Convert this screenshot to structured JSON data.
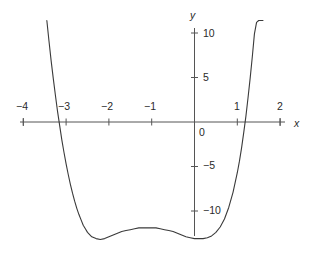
{
  "figure": {
    "background_color": "#ffffff",
    "curve_color": "#3a3a3a",
    "axis_color": "#555555",
    "text_color": "#2a2a2a"
  },
  "axes": {
    "x_axis_label": "x",
    "y_axis_label": "y",
    "x_ticks": [
      {
        "value": -4,
        "label": "−4"
      },
      {
        "value": -3,
        "label": "−3"
      },
      {
        "value": -2,
        "label": "−2"
      },
      {
        "value": -1,
        "label": "−1"
      },
      {
        "value": 1,
        "label": "1"
      },
      {
        "value": 2,
        "label": "2"
      }
    ],
    "y_ticks": [
      {
        "value": 10,
        "label": "10"
      },
      {
        "value": 5,
        "label": "5"
      },
      {
        "value": 0,
        "label": "0"
      },
      {
        "value": -5,
        "label": "−5"
      },
      {
        "value": -10,
        "label": "−10"
      }
    ],
    "origin_label": "0"
  },
  "chart_data": {
    "type": "line",
    "title": "",
    "subtitle": "",
    "xlabel": "x",
    "ylabel": "y",
    "xlim": [
      -4.4,
      2.4
    ],
    "ylim": [
      -13.2,
      11.5
    ],
    "grid": false,
    "legend": null,
    "series": [
      {
        "name": "quartic curve",
        "x": [
          -3.45,
          -3.4,
          -3.35,
          -3.3,
          -3.25,
          -3.2,
          -3.15,
          -3.1,
          -3.05,
          -3.0,
          -2.95,
          -2.9,
          -2.85,
          -2.8,
          -2.75,
          -2.7,
          -2.65,
          -2.6,
          -2.55,
          -2.5,
          -2.4,
          -2.3,
          -2.2,
          -2.1,
          -2.0,
          -1.9,
          -1.8,
          -1.7,
          -1.6,
          -1.5,
          -1.4,
          -1.3,
          -1.2,
          -1.1,
          -1.0,
          -0.9,
          -0.8,
          -0.7,
          -0.6,
          -0.5,
          -0.4,
          -0.3,
          -0.2,
          -0.1,
          0.0,
          0.1,
          0.2,
          0.3,
          0.4,
          0.5,
          0.6,
          0.7,
          0.8,
          0.9,
          1.0,
          1.05,
          1.1,
          1.15,
          1.2,
          1.25,
          1.3,
          1.35,
          1.4,
          1.45,
          1.5,
          1.55,
          1.6
        ],
        "y": [
          11.4,
          9.1,
          6.9,
          4.9,
          3.0,
          1.2,
          -0.4,
          -2.0,
          -3.4,
          -4.7,
          -5.9,
          -7.0,
          -8.0,
          -8.9,
          -9.7,
          -10.4,
          -11.0,
          -11.6,
          -12.0,
          -12.4,
          -12.9,
          -13.1,
          -13.2,
          -13.1,
          -12.9,
          -12.7,
          -12.5,
          -12.3,
          -12.2,
          -12.1,
          -12.0,
          -11.9,
          -11.9,
          -11.9,
          -11.9,
          -11.9,
          -12.0,
          -12.1,
          -12.2,
          -12.3,
          -12.5,
          -12.7,
          -12.9,
          -13.0,
          -13.1,
          -13.1,
          -13.1,
          -13.0,
          -12.8,
          -12.4,
          -11.8,
          -10.9,
          -9.6,
          -7.9,
          -5.7,
          -4.4,
          -2.9,
          -1.2,
          0.6,
          2.7,
          4.9,
          7.3,
          9.9,
          11.2,
          11.4,
          11.4,
          11.4
        ],
        "roots": [
          -3.07,
          1.03
        ],
        "local_minima": [
          {
            "x": -2.2,
            "y": -13.2
          },
          {
            "x": 0.0,
            "y": -13.1
          }
        ],
        "local_maxima": [
          {
            "x": -1.15,
            "y": -11.9
          }
        ]
      }
    ]
  }
}
